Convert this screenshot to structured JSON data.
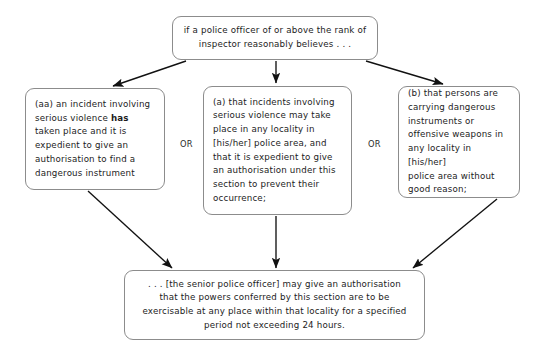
{
  "diagram": {
    "title_node": {
      "id": "premise",
      "text": "if a police officer of or above the rank of\ninspector reasonably believes . . ."
    },
    "condition_nodes": [
      {
        "id": "condition-aa",
        "label_prefix": "(aa)",
        "text_before_bold": "(aa) an incident involving\nserious violence ",
        "bold_word": "has",
        "text_after_bold": "\ntaken place and it is\nexpedient to give an\nauthorisation to find a\ndangerous instrument"
      },
      {
        "id": "condition-a",
        "label_prefix": "(a)",
        "text": "(a) that incidents involving\nserious violence may take\nplace in any locality in\n[his/her] police area, and\nthat it is expedient to give\nan authorisation under this\nsection to prevent their\noccurrence;"
      },
      {
        "id": "condition-b",
        "label_prefix": "(b)",
        "text": "(b) that persons are\ncarrying dangerous\ninstruments or\noffensive weapons in\nany locality in [his/her]\npolice area without\ngood reason;"
      }
    ],
    "connectors": [
      {
        "id": "or-left",
        "label": "OR"
      },
      {
        "id": "or-right",
        "label": "OR"
      }
    ],
    "outcome_node": {
      "id": "outcome",
      "text": ". . . [the senior police officer] may give an authorisation\nthat the powers conferred by this section are to be\nexercisable at any place within that locality for a specified\nperiod not exceeding 24 hours."
    }
  },
  "style": {
    "stroke_color": "#8c8c8c",
    "arrow_color": "#111111",
    "text_color": "#1c1c1c",
    "background": "#ffffff"
  }
}
